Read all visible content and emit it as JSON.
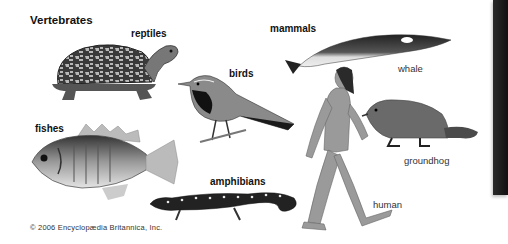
{
  "figure": {
    "title": "Vertebrates",
    "groups": {
      "reptiles": "reptiles",
      "birds": "birds",
      "mammals": "mammals",
      "fishes": "fishes",
      "amphibians": "amphibians"
    },
    "animals": {
      "whale": "whale",
      "groundhog": "groundhog",
      "human": "human"
    },
    "illustrations": [
      "turtle",
      "bird",
      "whale",
      "fish",
      "salamander",
      "human",
      "groundhog"
    ],
    "copyright": "© 2006 Encyclopædia Britannica, Inc.",
    "colors": {
      "background": "#ffffff",
      "text": "#111111",
      "side_bar": "#1a1a1a"
    }
  }
}
